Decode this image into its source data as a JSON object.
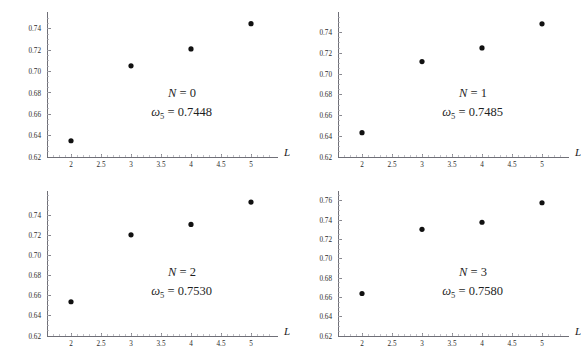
{
  "figure": {
    "background_color": "#ffffff",
    "point_color": "#111111",
    "axis_color": "#6f6f77",
    "layout": "2x2 grid of scatter panels"
  },
  "chart_data": [
    {
      "type": "scatter",
      "title": "",
      "subtitle": "",
      "xlabel": "L",
      "ylabel": "",
      "xlim": [
        1.6,
        5.35
      ],
      "ylim": [
        0.62,
        0.752
      ],
      "grid": false,
      "legend": "none",
      "x": [
        2,
        3,
        4,
        5
      ],
      "values": [
        0.6352,
        0.7054,
        0.7212,
        0.7448
      ],
      "xticks": [
        "2",
        "2.5",
        "3",
        "3.5",
        "4",
        "4.5",
        "5"
      ],
      "xtick_values": [
        2,
        2.5,
        3,
        3.5,
        4,
        4.5,
        5
      ],
      "yticks": [
        "0.62",
        "0.64",
        "0.66",
        "0.68",
        "0.70",
        "0.72",
        "0.74"
      ],
      "ytick_values": [
        0.62,
        0.64,
        0.66,
        0.68,
        0.7,
        0.72,
        0.74
      ],
      "annotations": {
        "line1_var": "N",
        "line1_eq": " = ",
        "line1_value": "0",
        "line2_var": "ω",
        "line2_sub": "5",
        "line2_eq": " = ",
        "line2_value": "0.7448"
      }
    },
    {
      "type": "scatter",
      "title": "",
      "subtitle": "",
      "xlabel": "L",
      "ylabel": "",
      "xlim": [
        1.6,
        5.35
      ],
      "ylim": [
        0.62,
        0.756
      ],
      "grid": false,
      "legend": "none",
      "x": [
        2,
        3,
        4,
        5
      ],
      "values": [
        0.6435,
        0.712,
        0.7252,
        0.7485
      ],
      "xticks": [
        "2",
        "2.5",
        "3",
        "3.5",
        "4",
        "4.5",
        "5"
      ],
      "xtick_values": [
        2,
        2.5,
        3,
        3.5,
        4,
        4.5,
        5
      ],
      "yticks": [
        "0.62",
        "0.64",
        "0.66",
        "0.68",
        "0.70",
        "0.72",
        "0.74"
      ],
      "ytick_values": [
        0.62,
        0.64,
        0.66,
        0.68,
        0.7,
        0.72,
        0.74
      ],
      "annotations": {
        "line1_var": "N",
        "line1_eq": " = ",
        "line1_value": "1",
        "line2_var": "ω",
        "line2_sub": "5",
        "line2_eq": " = ",
        "line2_value": "0.7485"
      }
    },
    {
      "type": "scatter",
      "title": "",
      "subtitle": "",
      "xlabel": "L",
      "ylabel": "",
      "xlim": [
        1.6,
        5.35
      ],
      "ylim": [
        0.62,
        0.76
      ],
      "grid": false,
      "legend": "none",
      "x": [
        2,
        3,
        4,
        5
      ],
      "values": [
        0.654,
        0.7205,
        0.7308,
        0.753
      ],
      "xticks": [
        "2",
        "2.5",
        "3",
        "3.5",
        "4",
        "4.5",
        "5"
      ],
      "xtick_values": [
        2,
        2.5,
        3,
        3.5,
        4,
        4.5,
        5
      ],
      "yticks": [
        "0.62",
        "0.64",
        "0.66",
        "0.68",
        "0.70",
        "0.72",
        "0.74"
      ],
      "ytick_values": [
        0.62,
        0.64,
        0.66,
        0.68,
        0.7,
        0.72,
        0.74
      ],
      "annotations": {
        "line1_var": "N",
        "line1_eq": " = ",
        "line1_value": "2",
        "line2_var": "ω",
        "line2_sub": "5",
        "line2_eq": " = ",
        "line2_value": "0.7530"
      }
    },
    {
      "type": "scatter",
      "title": "",
      "subtitle": "",
      "xlabel": "L",
      "ylabel": "",
      "xlim": [
        1.6,
        5.35
      ],
      "ylim": [
        0.62,
        0.766
      ],
      "grid": false,
      "legend": "none",
      "x": [
        2,
        3,
        4,
        5
      ],
      "values": [
        0.664,
        0.7305,
        0.7378,
        0.758
      ],
      "xticks": [
        "2",
        "2.5",
        "3",
        "3.5",
        "4",
        "4.5",
        "5"
      ],
      "xtick_values": [
        2,
        2.5,
        3,
        3.5,
        4,
        4.5,
        5
      ],
      "yticks": [
        "0.62",
        "0.64",
        "0.66",
        "0.68",
        "0.70",
        "0.72",
        "0.74",
        "0.76"
      ],
      "ytick_values": [
        0.62,
        0.64,
        0.66,
        0.68,
        0.7,
        0.72,
        0.74,
        0.76
      ],
      "annotations": {
        "line1_var": "N",
        "line1_eq": " = ",
        "line1_value": "3",
        "line2_var": "ω",
        "line2_sub": "5",
        "line2_eq": " = ",
        "line2_value": "0.7580"
      }
    }
  ]
}
